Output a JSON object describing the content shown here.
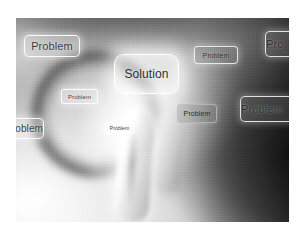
{
  "scene": {
    "kind": "stock-photo",
    "subject": "blurred grayscale hand with pointing index finger touching a floating touchscreen button",
    "palette": {
      "page_background": "#ffffff",
      "photo_light": "#e8e8e8",
      "photo_mid": "#8d8d8d",
      "photo_dark": "#1a1a1a",
      "box_border": "#ffffff",
      "box_text": "#3a3a3a"
    },
    "photo": {
      "left": 16,
      "top": 18,
      "width": 273,
      "height": 204
    }
  },
  "boxes": [
    {
      "id": "problem-top-left",
      "label": "Problem",
      "style": "light",
      "font_size": 11,
      "clipped": "none",
      "rect": {
        "left": 24,
        "top": 35,
        "width": 56,
        "height": 22
      }
    },
    {
      "id": "solution-center",
      "label": "Solution",
      "style": "solution",
      "font_size": 12,
      "clipped": "none",
      "rect": {
        "left": 114,
        "top": 54,
        "width": 65,
        "height": 40
      }
    },
    {
      "id": "problem-top-right",
      "label": "Problem",
      "style": "dark",
      "font_size": 7,
      "clipped": "none",
      "rect": {
        "left": 194,
        "top": 46,
        "width": 44,
        "height": 18
      }
    },
    {
      "id": "problem-right-edge-top",
      "label": "Pro",
      "style": "dark",
      "font_size": 11,
      "clipped": "right",
      "rect": {
        "left": 265,
        "top": 31,
        "width": 30,
        "height": 26
      }
    },
    {
      "id": "problem-mid-left",
      "label": "Problem",
      "style": "light",
      "font_size": 6,
      "clipped": "none",
      "rect": {
        "left": 61,
        "top": 89,
        "width": 37,
        "height": 15
      }
    },
    {
      "id": "problem-right-edge-mid",
      "label": "Problem",
      "style": "dark",
      "font_size": 11,
      "clipped": "right",
      "rect": {
        "left": 240,
        "top": 96,
        "width": 55,
        "height": 26
      }
    },
    {
      "id": "problem-shadowed-center-right",
      "label": "Problem",
      "style": "shadowed",
      "font_size": 7,
      "clipped": "none",
      "rect": {
        "left": 177,
        "top": 104,
        "width": 40,
        "height": 19
      }
    },
    {
      "id": "problem-left-edge",
      "label": "oblem",
      "style": "light",
      "font_size": 10,
      "clipped": "left",
      "rect": {
        "left": 10,
        "top": 118,
        "width": 34,
        "height": 21
      }
    },
    {
      "id": "problem-fingertip",
      "label": "Problem",
      "style": "light",
      "font_size": 5,
      "clipped": "none",
      "rect": {
        "left": 105,
        "top": 122,
        "width": 29,
        "height": 12
      }
    }
  ]
}
